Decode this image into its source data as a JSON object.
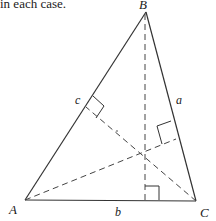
{
  "caption": "in each case.",
  "diagram": {
    "type": "triangle-with-altitudes",
    "vertices": {
      "A": {
        "label": "A",
        "x": 25,
        "y": 200
      },
      "B": {
        "label": "B",
        "x": 146,
        "y": 12
      },
      "C": {
        "label": "C",
        "x": 196,
        "y": 201
      }
    },
    "sides": {
      "a": {
        "label": "a",
        "between": "B-C"
      },
      "b": {
        "label": "b",
        "between": "A-C"
      },
      "c": {
        "label": "c",
        "between": "A-B"
      }
    },
    "altitudes": [
      {
        "from": "B",
        "foot_on": "AC",
        "style": "dashed"
      },
      {
        "from": "C",
        "foot_on": "AB",
        "style": "dashed"
      },
      {
        "from": "A",
        "foot_on": "BC",
        "style": "dashed"
      }
    ],
    "right_angle_markers": 3,
    "colors": {
      "line": "#333333",
      "text": "#1a1a1a",
      "background": "#ffffff"
    }
  }
}
